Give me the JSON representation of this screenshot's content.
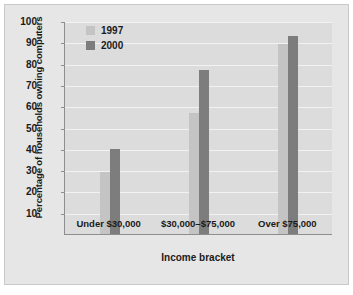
{
  "chart_data": {
    "type": "bar",
    "title": "",
    "subtitle": "",
    "xlabel": "Income bracket",
    "ylabel": "Percentage of households owning computers",
    "categories": [
      "Under $30,000",
      "$30,000–$75,000",
      "Over $75,000"
    ],
    "series": [
      {
        "name": "1997",
        "color": "#c4c4c4",
        "values": [
          29,
          57,
          89
        ]
      },
      {
        "name": "2000",
        "color": "#7d7d7d",
        "values": [
          40,
          77,
          93
        ]
      }
    ],
    "ylim": [
      0,
      100
    ],
    "ytick_values": [
      10,
      20,
      30,
      40,
      50,
      60,
      70,
      80,
      90,
      100
    ],
    "ytick_labels": [
      "10",
      "20",
      "30",
      "40",
      "50",
      "60",
      "70",
      "80",
      "90",
      "100"
    ],
    "grid": "horizontal",
    "legend_position": "top-left-inside",
    "plot_background": "#dcdcdc",
    "gridline_color": "#f2f2f2",
    "figure_background": "#e6e6e6",
    "axis_color": "#8e8e8e",
    "annotations": []
  }
}
